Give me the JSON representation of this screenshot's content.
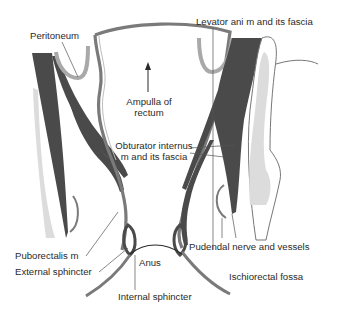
{
  "diagram": {
    "type": "anatomical-illustration",
    "colors": {
      "muscle_dark": "#4a4a4a",
      "rectal_wall": "#7a7a7a",
      "peritoneum": "#a9a9a9",
      "bone_light": "#dcdcdc",
      "leader_line": "#555555",
      "text": "#2a2a2a"
    },
    "labels": {
      "peritoneum": "Peritoneum",
      "levator_ani": "Levator ani m and its fascia",
      "ampulla_line1": "Ampulla of",
      "ampulla_line2": "rectum",
      "obturator_line1": "Obturator internus",
      "obturator_line2": "m and its fascia",
      "puborectalis": "Puborectalis m",
      "external_sphincter": "External sphincter",
      "anus": "Anus",
      "internal_sphincter": "Internal sphincter",
      "pudendal": "Pudendal nerve and vessels",
      "ischiorectal": "Ischiorectal fossa"
    }
  }
}
